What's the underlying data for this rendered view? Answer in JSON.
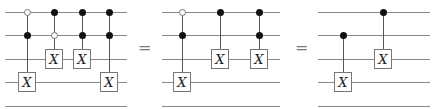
{
  "wires_y": [
    12,
    35,
    59,
    82,
    106
  ],
  "equals_sign": "=",
  "gate_label": "X",
  "circuits": [
    {
      "name": "left-circuit",
      "x_start": 5,
      "x_end": 127,
      "gates": [
        {
          "x": 27,
          "controls": [
            {
              "wire": 0,
              "type": "open"
            },
            {
              "wire": 1,
              "type": "filled"
            }
          ],
          "target": 3
        },
        {
          "x": 54,
          "controls": [
            {
              "wire": 0,
              "type": "filled"
            },
            {
              "wire": 1,
              "type": "open"
            }
          ],
          "target": 2
        },
        {
          "x": 82,
          "controls": [
            {
              "wire": 0,
              "type": "filled"
            },
            {
              "wire": 1,
              "type": "filled"
            }
          ],
          "target": 2
        },
        {
          "x": 109,
          "controls": [
            {
              "wire": 0,
              "type": "filled"
            },
            {
              "wire": 1,
              "type": "filled"
            }
          ],
          "target": 3
        }
      ]
    },
    {
      "name": "middle-circuit",
      "x_start": 162,
      "x_end": 280,
      "gates": [
        {
          "x": 182,
          "controls": [
            {
              "wire": 0,
              "type": "open"
            },
            {
              "wire": 1,
              "type": "filled"
            }
          ],
          "target": 3
        },
        {
          "x": 220,
          "controls": [
            {
              "wire": 0,
              "type": "filled"
            }
          ],
          "target": 2
        },
        {
          "x": 259,
          "controls": [
            {
              "wire": 0,
              "type": "filled"
            },
            {
              "wire": 1,
              "type": "filled"
            }
          ],
          "target": 2
        }
      ]
    },
    {
      "name": "right-circuit",
      "x_start": 318,
      "x_end": 430,
      "gates": [
        {
          "x": 343,
          "controls": [
            {
              "wire": 1,
              "type": "filled"
            }
          ],
          "target": 3
        },
        {
          "x": 383,
          "controls": [
            {
              "wire": 0,
              "type": "filled"
            }
          ],
          "target": 2
        }
      ]
    }
  ],
  "equals_positions": [
    138,
    295
  ]
}
